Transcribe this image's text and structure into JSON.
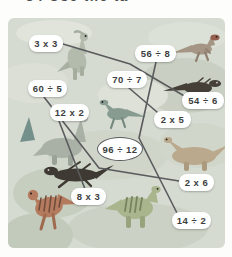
{
  "page": {
    "heading_partial": "34  Use the ta",
    "background_color": "#fdfdfc"
  },
  "panel": {
    "background_color": "#d6dbd2",
    "line_color": "#5a5b5d",
    "tile_background": "#ffffff",
    "tile_text_color": "#3c3e40"
  },
  "puzzle": {
    "labels": [
      {
        "id": "3x3",
        "text": "3 x 3"
      },
      {
        "id": "56div8",
        "text": "56 ÷ 8"
      },
      {
        "id": "70div7",
        "text": "70 ÷ 7"
      },
      {
        "id": "60div5",
        "text": "60 ÷ 5"
      },
      {
        "id": "54div6",
        "text": "54 ÷ 6"
      },
      {
        "id": "12x2",
        "text": "12 x 2"
      },
      {
        "id": "2x5",
        "text": "2 x 5"
      },
      {
        "id": "96div12",
        "text": "96 ÷ 12",
        "circled": true
      },
      {
        "id": "2x6",
        "text": "2 x 6"
      },
      {
        "id": "8x3",
        "text": "8 x 3"
      },
      {
        "id": "14div2",
        "text": "14 ÷ 2"
      }
    ],
    "connections": [
      [
        "3 x 3",
        "54 ÷ 6"
      ],
      [
        "56 ÷ 8",
        "14 ÷ 2"
      ],
      [
        "70 ÷ 7",
        "2 x 5"
      ],
      [
        "60 ÷ 5",
        "2 x 6"
      ],
      [
        "12 x 2",
        "8 x 3"
      ]
    ],
    "circled_label": "96 ÷ 12"
  },
  "dinosaurs": [
    {
      "name": "parasaurolophus-upright",
      "color": "#b3bbad"
    },
    {
      "name": "raptor-tan",
      "color": "#a59584",
      "head_color": "#96604e"
    },
    {
      "name": "raptor-dark",
      "color": "#453f38"
    },
    {
      "name": "raptor-teal",
      "color": "#879b91"
    },
    {
      "name": "tail-fin-teal",
      "color": "#74908a"
    },
    {
      "name": "sauropod-gray",
      "color": "#a9b0a6"
    },
    {
      "name": "sauropod-tan",
      "color": "#bba98e"
    },
    {
      "name": "runner-black",
      "color": "#3e3932"
    },
    {
      "name": "striped-rust",
      "color": "#b57b5e",
      "stripe_color": "#6e4a3a"
    },
    {
      "name": "iguanodon-green",
      "color": "#a9b58d",
      "stripe_color": "#76845f"
    }
  ]
}
